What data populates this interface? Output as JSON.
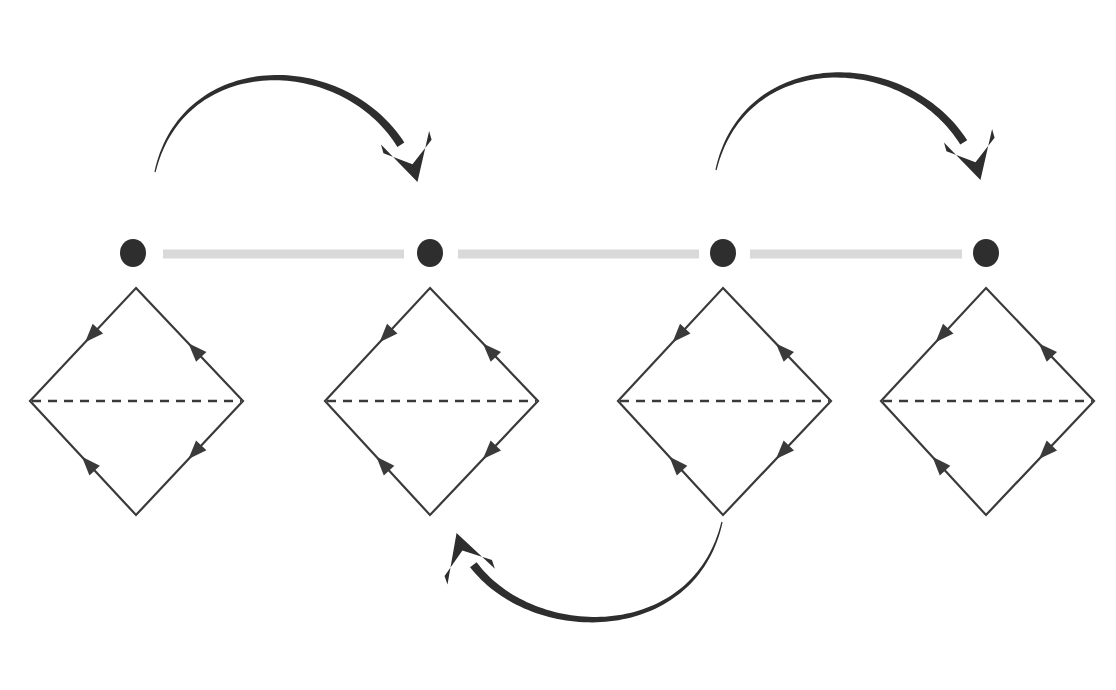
{
  "figure": {
    "title": "Chain of four directed rhombus cells linked by a dotted spine with three curved transition arrows",
    "width": 1116,
    "height": 690,
    "background_color": "#ffffff"
  },
  "colors": {
    "ink": "#2b2b2b",
    "rhombus_stroke": "#3a3a3a",
    "dashed_stroke": "#3a3a3a",
    "dot_fill": "#2e2e2e",
    "spine_segment": "#d9d9d9",
    "curved_arrow": "#2e2e2e"
  },
  "spine": {
    "label": "dotted spine",
    "y": 253,
    "dot_radius_x": 13,
    "dot_radius_y": 14,
    "nodes": [
      {
        "id": "node-1",
        "cx": 133,
        "cy": 253
      },
      {
        "id": "node-2",
        "cx": 430,
        "cy": 253
      },
      {
        "id": "node-3",
        "cx": 723,
        "cy": 253
      },
      {
        "id": "node-4",
        "cx": 986,
        "cy": 253
      }
    ],
    "segments": [
      {
        "id": "spine-segment-1",
        "x1": 163,
        "x2": 404,
        "y": 254,
        "thickness": 9
      },
      {
        "id": "spine-segment-2",
        "x1": 458,
        "x2": 699,
        "y": 254,
        "thickness": 9
      },
      {
        "id": "spine-segment-3",
        "x1": 750,
        "x2": 962,
        "y": 254,
        "thickness": 9
      }
    ]
  },
  "rhombi": [
    {
      "id": "rhombus-1",
      "label": "rhombus cell 1",
      "cx": 136,
      "top_y": 288,
      "bottom_y": 515,
      "left_x": 30,
      "right_x": 243,
      "mid_y": 401,
      "stroke_width": 2.2,
      "edges": [
        {
          "id": "edge-top-left",
          "from": "top",
          "to": "left",
          "arrow_t": 0.42,
          "direction": "down-left"
        },
        {
          "id": "edge-top-right",
          "from": "right",
          "to": "top",
          "arrow_t": 0.45,
          "direction": "up-left"
        },
        {
          "id": "edge-bottom-left",
          "from": "bottom",
          "to": "left",
          "arrow_t": 0.45,
          "direction": "up-left"
        },
        {
          "id": "edge-bottom-right",
          "from": "right",
          "to": "bottom",
          "arrow_t": 0.45,
          "direction": "down-left"
        }
      ],
      "dashed_midline": true
    },
    {
      "id": "rhombus-2",
      "label": "rhombus cell 2",
      "cx": 430,
      "top_y": 288,
      "bottom_y": 515,
      "left_x": 325,
      "right_x": 538,
      "mid_y": 401,
      "stroke_width": 2.2,
      "edges": [
        {
          "id": "edge-top-left",
          "from": "top",
          "to": "left",
          "arrow_t": 0.42,
          "direction": "down-left"
        },
        {
          "id": "edge-top-right",
          "from": "right",
          "to": "top",
          "arrow_t": 0.45,
          "direction": "up-left"
        },
        {
          "id": "edge-bottom-left",
          "from": "bottom",
          "to": "left",
          "arrow_t": 0.45,
          "direction": "up-left"
        },
        {
          "id": "edge-bottom-right",
          "from": "right",
          "to": "bottom",
          "arrow_t": 0.45,
          "direction": "down-left"
        }
      ],
      "dashed_midline": true
    },
    {
      "id": "rhombus-3",
      "label": "rhombus cell 3",
      "cx": 723,
      "top_y": 288,
      "bottom_y": 515,
      "left_x": 618,
      "right_x": 831,
      "mid_y": 401,
      "stroke_width": 2.2,
      "edges": [
        {
          "id": "edge-top-left",
          "from": "top",
          "to": "left",
          "arrow_t": 0.42,
          "direction": "down-left"
        },
        {
          "id": "edge-top-right",
          "from": "right",
          "to": "top",
          "arrow_t": 0.45,
          "direction": "up-left"
        },
        {
          "id": "edge-bottom-left",
          "from": "bottom",
          "to": "left",
          "arrow_t": 0.45,
          "direction": "up-left"
        },
        {
          "id": "edge-bottom-right",
          "from": "right",
          "to": "bottom",
          "arrow_t": 0.45,
          "direction": "down-left"
        }
      ],
      "dashed_midline": true
    },
    {
      "id": "rhombus-4",
      "label": "rhombus cell 4",
      "cx": 986,
      "top_y": 288,
      "bottom_y": 515,
      "left_x": 881,
      "right_x": 1094,
      "mid_y": 401,
      "stroke_width": 2.2,
      "edges": [
        {
          "id": "edge-top-left",
          "from": "top",
          "to": "left",
          "arrow_t": 0.42,
          "direction": "down-left"
        },
        {
          "id": "edge-top-right",
          "from": "right",
          "to": "top",
          "arrow_t": 0.45,
          "direction": "up-left"
        },
        {
          "id": "edge-bottom-left",
          "from": "bottom",
          "to": "left",
          "arrow_t": 0.45,
          "direction": "up-left"
        },
        {
          "id": "edge-bottom-right",
          "from": "right",
          "to": "bottom",
          "arrow_t": 0.45,
          "direction": "down-left"
        }
      ],
      "dashed_midline": true
    }
  ],
  "curved_arrows": [
    {
      "id": "curved-arrow-1",
      "label": "transition arrow from cell 1 to cell 2",
      "style": "hand-drawn tapered arc",
      "from_node": "node-1",
      "to_node": "node-2",
      "direction": "left-to-right, clockwise over the top",
      "tail": {
        "x": 155,
        "y": 172
      },
      "head": {
        "x": 419,
        "y": 188
      }
    },
    {
      "id": "curved-arrow-2",
      "label": "transition arrow from cell 3 to cell 4",
      "style": "hand-drawn tapered arc",
      "from_node": "node-3",
      "to_node": "node-4",
      "direction": "left-to-right, clockwise over the top",
      "tail": {
        "x": 716,
        "y": 170
      },
      "head": {
        "x": 982,
        "y": 186
      }
    },
    {
      "id": "curved-arrow-3",
      "label": "return arrow from cell 3 to cell 2 under the row",
      "style": "hand-drawn tapered arc",
      "from_node": "node-3",
      "to_node": "node-2",
      "direction": "right-to-left, counter-clockwise under the bottom",
      "tail": {
        "x": 722,
        "y": 522
      },
      "head": {
        "x": 455,
        "y": 528
      }
    }
  ]
}
